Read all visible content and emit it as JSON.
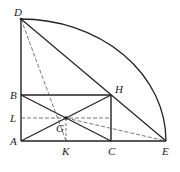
{
  "diagram": {
    "type": "geometry",
    "points": {
      "D": {
        "label": "D",
        "x": 21,
        "y": 19
      },
      "B": {
        "label": "B",
        "x": 21,
        "y": 95
      },
      "L": {
        "label": "L",
        "x": 21,
        "y": 118
      },
      "A": {
        "label": "A",
        "x": 21,
        "y": 141
      },
      "G": {
        "label": "G",
        "x": 66,
        "y": 118
      },
      "K": {
        "label": "K",
        "x": 66,
        "y": 141
      },
      "C": {
        "label": "C",
        "x": 111,
        "y": 141
      },
      "H": {
        "label": "H",
        "x": 111,
        "y": 95
      },
      "E": {
        "label": "E",
        "x": 166,
        "y": 141
      }
    },
    "solid_segments": [
      "DA",
      "AE",
      "BH",
      "HC",
      "BC",
      "AH",
      "DE"
    ],
    "dashed_segments": [
      "DK",
      "LG",
      "GE",
      "GK",
      "GH"
    ],
    "arc": {
      "from": "D",
      "to": "E",
      "center": "A"
    },
    "stroke_color": "#222222",
    "dash_color": "#555555"
  }
}
